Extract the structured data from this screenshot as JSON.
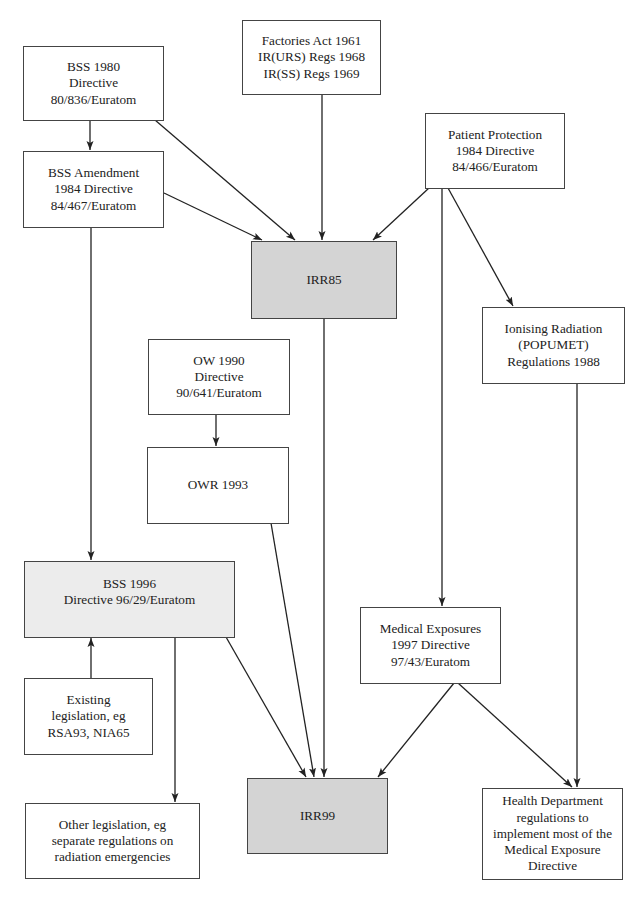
{
  "diagram": {
    "nodes": {
      "bss1980": {
        "lines": [
          "BSS 1980",
          "Directive",
          "80/836/Euratom"
        ]
      },
      "factories": {
        "lines": [
          "Factories Act 1961",
          "IR(URS) Regs 1968",
          "IR(SS) Regs 1969"
        ]
      },
      "bss_amendment": {
        "lines": [
          "BSS Amendment",
          "1984 Directive",
          "84/467/Euratom"
        ]
      },
      "patient_protection": {
        "lines": [
          "Patient Protection",
          "1984 Directive",
          "84/466/Euratom"
        ]
      },
      "irr85": {
        "lines": [
          "IRR85"
        ]
      },
      "popumet": {
        "lines": [
          "Ionising Radiation",
          "(POPUMET)",
          "Regulations 1988"
        ]
      },
      "ow1990": {
        "lines": [
          "OW 1990",
          "Directive",
          "90/641/Euratom"
        ]
      },
      "owr1993": {
        "lines": [
          "OWR 1993"
        ]
      },
      "bss1996": {
        "lines": [
          "BSS 1996",
          "Directive 96/29/Euratom"
        ]
      },
      "medical_exposures": {
        "lines": [
          "Medical Exposures",
          "1997 Directive",
          "97/43/Euratom"
        ]
      },
      "existing_legislation": {
        "lines": [
          "Existing",
          "legislation, eg",
          "RSA93, NIA65"
        ]
      },
      "irr99": {
        "lines": [
          "IRR99"
        ]
      },
      "other_legislation": {
        "lines": [
          "Other legislation, eg",
          "separate regulations on",
          "radiation emergencies"
        ]
      },
      "health_department": {
        "lines": [
          "Health Department",
          "regulations to",
          "implement most of the",
          "Medical Exposure",
          "Directive"
        ]
      }
    },
    "edges": [
      {
        "from": "bss1980",
        "to": "bss_amendment"
      },
      {
        "from": "bss1980",
        "to": "irr85"
      },
      {
        "from": "factories",
        "to": "irr85"
      },
      {
        "from": "bss_amendment",
        "to": "irr85"
      },
      {
        "from": "patient_protection",
        "to": "irr85"
      },
      {
        "from": "patient_protection",
        "to": "popumet"
      },
      {
        "from": "patient_protection",
        "to": "medical_exposures"
      },
      {
        "from": "bss_amendment",
        "to": "bss1996"
      },
      {
        "from": "ow1990",
        "to": "owr1993"
      },
      {
        "from": "irr85",
        "to": "irr99"
      },
      {
        "from": "owr1993",
        "to": "irr99"
      },
      {
        "from": "bss1996",
        "to": "irr99"
      },
      {
        "from": "existing_legislation",
        "to": "bss1996"
      },
      {
        "from": "bss1996",
        "to": "other_legislation"
      },
      {
        "from": "medical_exposures",
        "to": "irr99"
      },
      {
        "from": "medical_exposures",
        "to": "health_department"
      },
      {
        "from": "popumet",
        "to": "health_department"
      }
    ],
    "colors": {
      "box_border": "#444444",
      "highlight_dark": "#d4d4d4",
      "highlight_light": "#ececec",
      "arrow": "#222222"
    }
  }
}
